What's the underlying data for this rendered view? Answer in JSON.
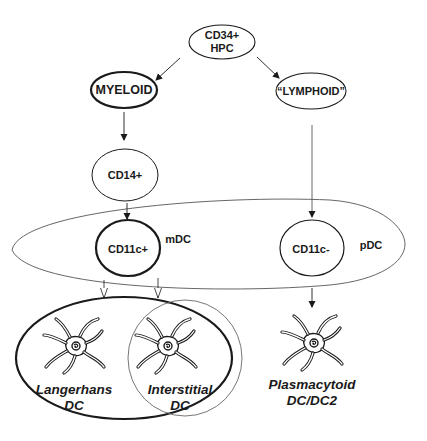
{
  "diagram": {
    "nodes": {
      "hpc": {
        "line1": "CD34+",
        "line2": "HPC"
      },
      "myeloid": {
        "label": "MYELOID"
      },
      "lymphoid": {
        "label": "“LYMPHOID”"
      },
      "cd14": {
        "label": "CD14+"
      },
      "cd11c_pos": {
        "label": "CD11c+"
      },
      "cd11c_neg": {
        "label": "CD11c-"
      },
      "mdc": {
        "label": "mDC"
      },
      "pdc": {
        "label": "pDC"
      }
    },
    "cells": {
      "langerhans": {
        "line1": "Langerhans",
        "line2": "DC",
        "icon": "dendritic-cell-icon"
      },
      "interstitial": {
        "line1": "Interstitial",
        "line2": "DC",
        "icon": "dendritic-cell-icon"
      },
      "plasmacytoid": {
        "line1": "Plasmacytoid",
        "line2": "DC/DC2",
        "icon": "dendritic-cell-icon"
      }
    },
    "edges": [
      {
        "from": "CD34+ HPC",
        "to": "MYELOID"
      },
      {
        "from": "CD34+ HPC",
        "to": "LYMPHOID"
      },
      {
        "from": "MYELOID",
        "to": "CD14+"
      },
      {
        "from": "CD14+",
        "to": "CD11c+"
      },
      {
        "from": "LYMPHOID",
        "to": "CD11c-"
      },
      {
        "from": "CD11c+",
        "to": "Langerhans DC"
      },
      {
        "from": "CD11c+",
        "to": "Interstitial DC"
      },
      {
        "from": "CD11c-",
        "to": "Plasmacytoid DC/DC2"
      }
    ],
    "colors": {
      "line": "#1a1a1a",
      "thin_line": "#555555",
      "text": "#1a1a1a"
    }
  },
  "caption": {
    "text": ""
  }
}
